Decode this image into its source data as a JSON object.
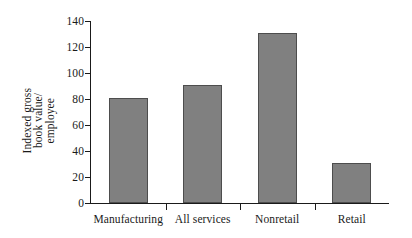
{
  "chart_data": {
    "type": "bar",
    "title": "",
    "subtitle": "",
    "xlabel": "",
    "ylabel_lines": [
      "Indexed gross",
      "book value/",
      "employee"
    ],
    "ylabel": "Indexed gross book value/ employee",
    "categories": [
      "Manufacturing",
      "All services",
      "Nonretail",
      "Retail"
    ],
    "values": [
      81,
      91,
      131,
      31
    ],
    "ylim": [
      0,
      140
    ],
    "yticks": [
      0,
      20,
      40,
      60,
      80,
      100,
      120,
      140
    ],
    "ytick_labels": [
      "0",
      "20",
      "40",
      "60",
      "80",
      "100",
      "120",
      "140"
    ],
    "grid": false,
    "legend": null,
    "bar_color": "#808080",
    "bar_border_color": "#4d4d4d",
    "axis_color": "#1a1a1a",
    "background": "#ffffff"
  }
}
